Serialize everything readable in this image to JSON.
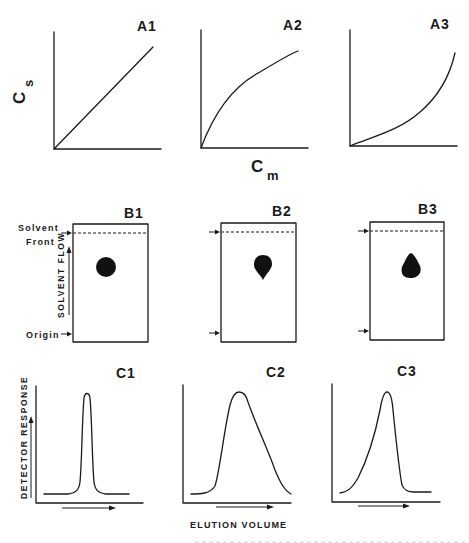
{
  "figure": {
    "row_a": {
      "y_axis_label": "C",
      "y_axis_subscript": "s",
      "x_axis_label": "C",
      "x_axis_subscript": "m",
      "panels": [
        {
          "label": "A1",
          "isotherm": "linear"
        },
        {
          "label": "A2",
          "isotherm": "concave (Langmuir-type)"
        },
        {
          "label": "A3",
          "isotherm": "convex (anti-Langmuir-type)"
        }
      ]
    },
    "row_b": {
      "solvent_front_label_line1": "Solvent",
      "solvent_front_label_line2": "Front",
      "origin_label": "Origin",
      "flow_label": "SOLVENT FLOW",
      "panels": [
        {
          "label": "B1",
          "spot_shape": "round"
        },
        {
          "label": "B2",
          "spot_shape": "tailing (tail toward origin)"
        },
        {
          "label": "B3",
          "spot_shape": "fronting (tail toward solvent front)"
        }
      ]
    },
    "row_c": {
      "y_axis_label": "DETECTOR RESPONSE",
      "x_axis_label": "ELUTION VOLUME",
      "panels": [
        {
          "label": "C1",
          "peak_shape": "symmetric narrow"
        },
        {
          "label": "C2",
          "peak_shape": "tailing"
        },
        {
          "label": "C3",
          "peak_shape": "fronting"
        }
      ]
    }
  },
  "colors": {
    "ink": "#1a1a1a",
    "background": "#ffffff"
  }
}
